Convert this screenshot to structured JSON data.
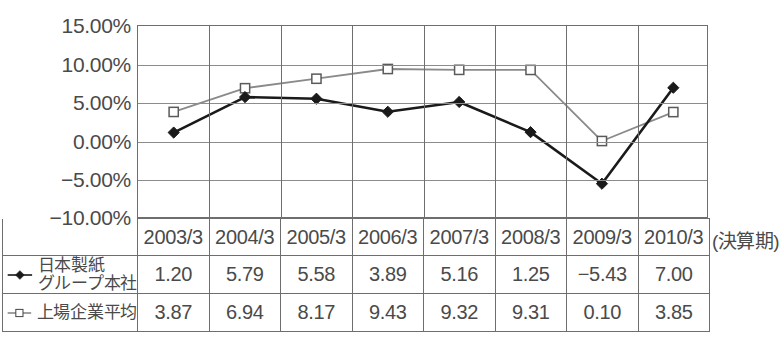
{
  "chart_data": {
    "type": "line",
    "title": "",
    "xlabel": "(決算期)",
    "ylabel": "",
    "categories": [
      "2003/3",
      "2004/3",
      "2005/3",
      "2006/3",
      "2007/3",
      "2008/3",
      "2009/3",
      "2010/3"
    ],
    "ylim": [
      -10,
      15
    ],
    "ytick_labels": [
      "15.00%",
      "10.00%",
      "5.00%",
      "0.00%",
      "-5.00%",
      "-10.00%"
    ],
    "ytick_values": [
      15,
      10,
      5,
      0,
      -5,
      -10
    ],
    "grid": true,
    "legend_position": "table-left",
    "series": [
      {
        "name": "日本製紙グループ本社",
        "name_line1": "日本製紙",
        "name_line2": "グループ本社",
        "marker": "filled-diamond",
        "color": "#1a1a1a",
        "values": [
          1.2,
          5.79,
          5.58,
          3.89,
          5.16,
          1.25,
          -5.43,
          7.0
        ],
        "labels": [
          "1.20",
          "5.79",
          "5.58",
          "3.89",
          "5.16",
          "1.25",
          "−5.43",
          "7.00"
        ]
      },
      {
        "name": "上場企業平均",
        "name_line1": "上場企業平均",
        "name_line2": "",
        "marker": "open-square",
        "color": "#8a8a8a",
        "values": [
          3.87,
          6.94,
          8.17,
          9.43,
          9.32,
          9.31,
          0.1,
          3.85
        ],
        "labels": [
          "3.87",
          "6.94",
          "8.17",
          "9.43",
          "9.32",
          "9.31",
          "0.10",
          "3.85"
        ]
      }
    ]
  },
  "axis": {
    "y_labels": [
      "15.00%",
      "10.00%",
      "5.00%",
      "0.00%",
      "−5.00%",
      "−10.00%"
    ],
    "x_axis_caption": "(決算期)"
  },
  "colors": {
    "series1": "#1a1a1a",
    "series2": "#8a8a8a",
    "grid": "#8c8c8c",
    "border": "#6e6e6e",
    "text": "#4a4a4a",
    "background": "#ffffff"
  }
}
